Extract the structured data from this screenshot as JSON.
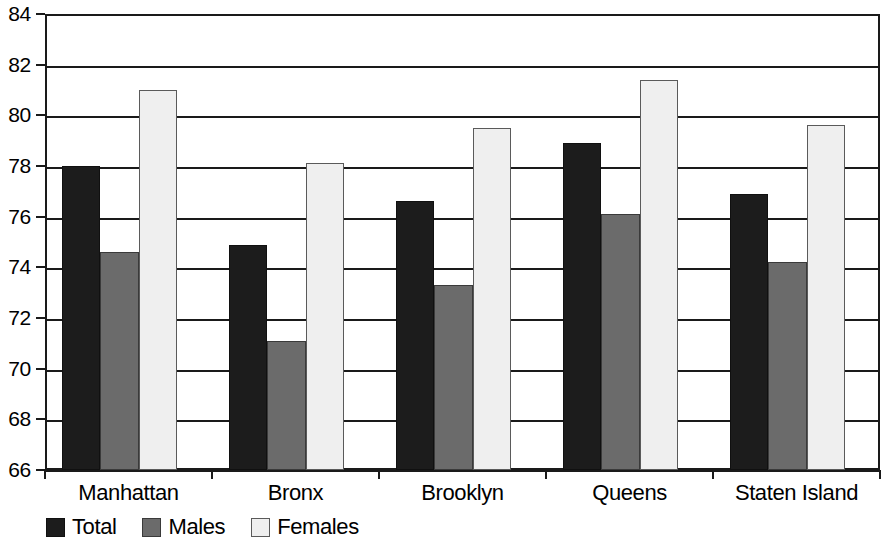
{
  "chart_data": {
    "type": "bar",
    "title": "",
    "subtitle": "",
    "xlabel": "",
    "ylabel": "",
    "categories": [
      "Manhattan",
      "Bronx",
      "Brooklyn",
      "Queens",
      "Staten Island"
    ],
    "series": [
      {
        "name": "Total",
        "color": "#1c1c1c",
        "values": [
          78.0,
          74.9,
          76.6,
          78.9,
          76.9
        ]
      },
      {
        "name": "Males",
        "color": "#6b6b6b",
        "values": [
          74.6,
          71.1,
          73.3,
          76.1,
          74.2
        ]
      },
      {
        "name": "Females",
        "color": "#efefef",
        "values": [
          81.0,
          78.1,
          79.5,
          81.4,
          79.6
        ]
      }
    ],
    "ylim": [
      66,
      84
    ],
    "ytick_step": 2,
    "ytick_labels": [
      "66",
      "68",
      "70",
      "72",
      "74",
      "76",
      "78",
      "80",
      "82",
      "84"
    ],
    "grid": true,
    "grid_axis": "y",
    "legend_position": "bottom-left",
    "legend_entries": [
      "Total",
      "Males",
      "Females"
    ],
    "annotations": []
  },
  "legend": {
    "items": [
      {
        "label": "Total",
        "swatch": "total"
      },
      {
        "label": "Males",
        "swatch": "males"
      },
      {
        "label": "Females",
        "swatch": "females"
      }
    ]
  },
  "axes": {
    "y_axis_name": "y-axis",
    "x_axis_name": "x-axis"
  }
}
